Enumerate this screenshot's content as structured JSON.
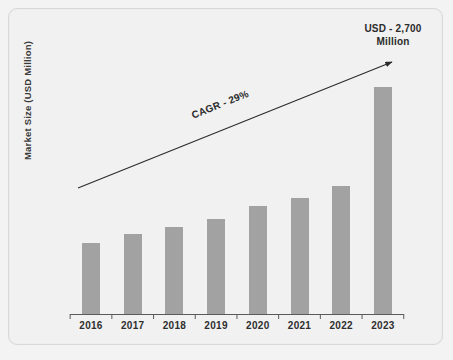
{
  "chart_data": {
    "type": "bar",
    "title": "",
    "xlabel": "",
    "ylabel": "Market Size (USD Million)",
    "categories": [
      "2016",
      "2017",
      "2018",
      "2019",
      "2020",
      "2021",
      "2022",
      "2023"
    ],
    "values": [
      840,
      950,
      1040,
      1130,
      1280,
      1380,
      1520,
      2700
    ],
    "value_unit": "USD Million",
    "ylim": [
      0,
      2900
    ],
    "grid": false,
    "legend": null,
    "bar_color": "#a2a2a2",
    "annotations": [
      {
        "name": "cagr-label",
        "text": "CAGR - 29%",
        "rotation_deg": -21.8
      },
      {
        "name": "endpoint-callout",
        "line1": "USD - 2,700",
        "line2": "Million"
      },
      {
        "name": "trend-arrow",
        "from": [
          78,
          188
        ],
        "to": [
          392,
          62
        ],
        "style": "single-headed"
      }
    ],
    "bar_pixel_tops": [
      207,
      193,
      182,
      170,
      152,
      139,
      122,
      87
    ],
    "baseline_y": 314
  },
  "colors": {
    "background": "#f1f1f1",
    "page_background": "#f3f3f3",
    "bar": "#a2a2a2",
    "frame_border": "#d8d8d8",
    "axis": "#5a5a5a",
    "text": "#2b2b2b"
  }
}
